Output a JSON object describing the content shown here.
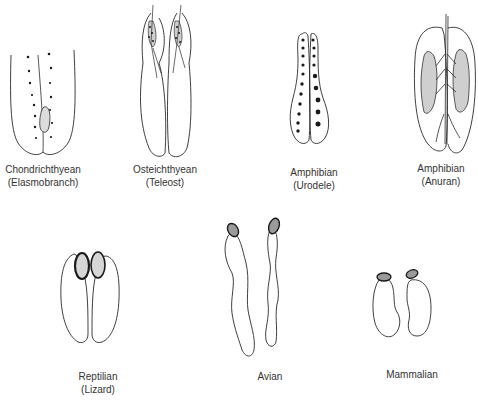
{
  "figure": {
    "panels": [
      {
        "id": "chondrichthyean",
        "title": "Chondrichthyean",
        "subtitle": "(Elasmobranch)"
      },
      {
        "id": "osteichthyean",
        "title": "Osteichthyean",
        "subtitle": "(Teleost)"
      },
      {
        "id": "amphibian-urodele",
        "title": "Amphibian",
        "subtitle": "(Urodele)"
      },
      {
        "id": "amphibian-anuran",
        "title": "Amphibian",
        "subtitle": "(Anuran)"
      },
      {
        "id": "reptilian",
        "title": "Reptilian",
        "subtitle": "(Lizard)"
      },
      {
        "id": "avian",
        "title": "Avian",
        "subtitle": ""
      },
      {
        "id": "mammalian",
        "title": "Mammalian",
        "subtitle": ""
      }
    ],
    "colors": {
      "line": "#2a2a2a",
      "stipple": "#bdbdbd",
      "dark": "#1a1a1a",
      "background": "#ffffff"
    }
  }
}
